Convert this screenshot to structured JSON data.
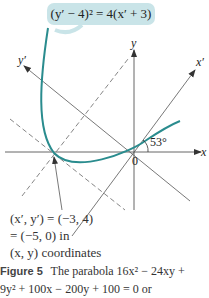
{
  "figure": {
    "callout_equation": "(y′ − 4)² = 4(x′ + 3)",
    "axis_labels": {
      "x": "x",
      "y": "y",
      "x_prime": "x′",
      "y_prime": "y′",
      "origin": "0"
    },
    "angle_label": "53°",
    "vertex_note": {
      "line1": "(x′, y′) = (−3, 4)",
      "line2": "= (−5, 0) in",
      "line3": "(x, y) coordinates"
    },
    "colors": {
      "curve": "#2a8c8e",
      "callout_bg": "#c9e4e8",
      "axes": "#444444"
    }
  },
  "caption": {
    "label": "Figure 5",
    "line1": "The parabola 16x² − 24xy +",
    "line2": "9y² + 100x − 200y + 100 = 0 or"
  }
}
